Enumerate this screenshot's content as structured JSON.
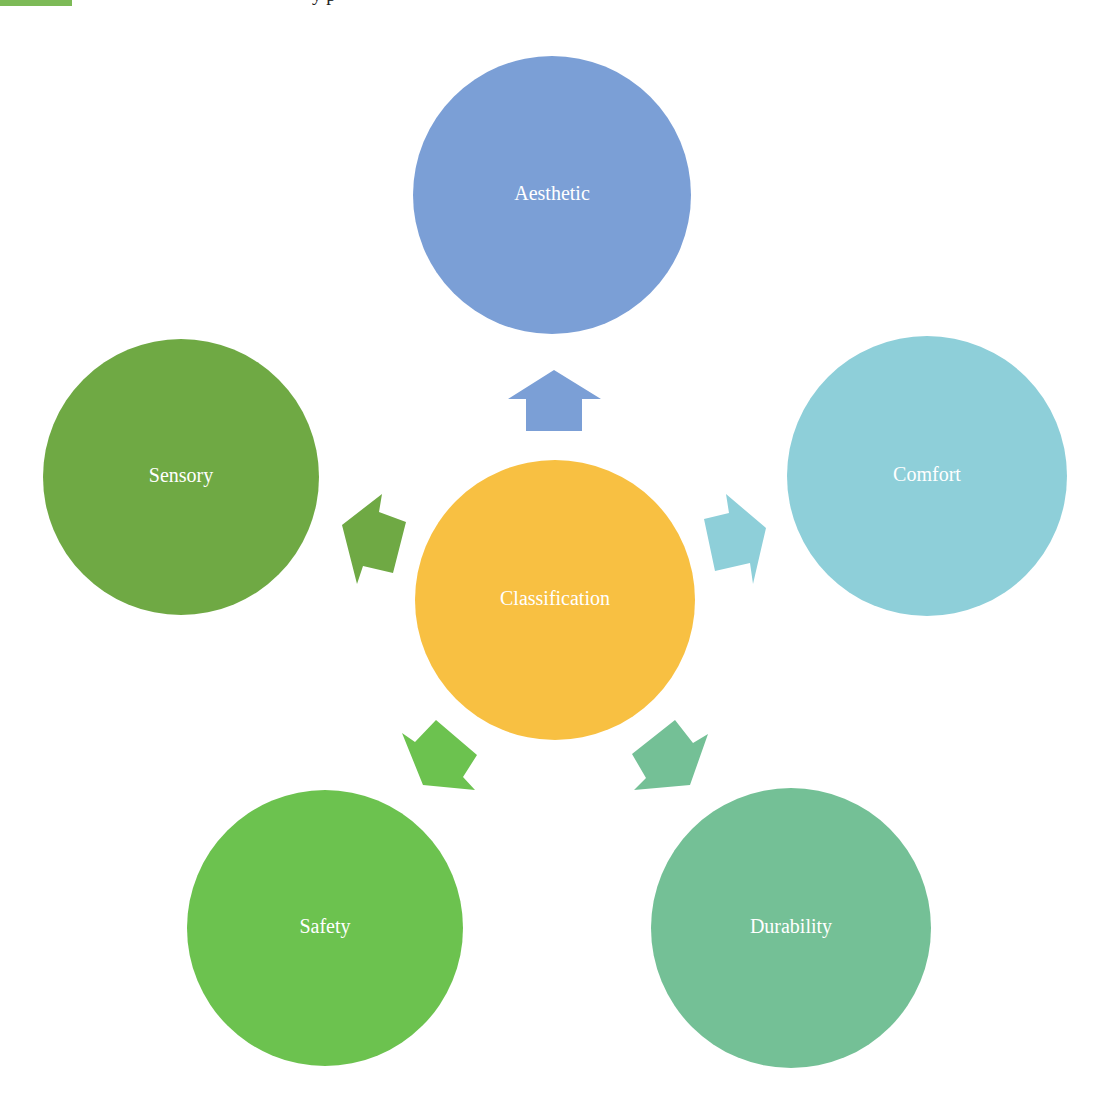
{
  "page": {
    "top_remnant_color": "#7DBA57",
    "clipped_header_text": "y p"
  },
  "diagram": {
    "type": "radial-cycle",
    "center": {
      "label": "Classification",
      "color": "#F8C042",
      "cx": 555,
      "cy": 600,
      "r": 140
    },
    "nodes": [
      {
        "id": "aesthetic",
        "label": "Aesthetic",
        "color": "#7B9FD6",
        "cx": 552,
        "cy": 195,
        "r": 139,
        "arrow": {
          "color": "#7B9FD6",
          "points": "554,370 601,399 582,399 582,431 526,431 526,399 508,399"
        }
      },
      {
        "id": "comfort",
        "label": "Comfort",
        "color": "#8ECFD9",
        "cx": 927,
        "cy": 476,
        "r": 140,
        "arrow": {
          "color": "#8ECFD9",
          "points": "726,494 729,513 704,519 715,571 750,563 753,584 766,528"
        }
      },
      {
        "id": "durability",
        "label": "Durability",
        "color": "#74C096",
        "cx": 791,
        "cy": 928,
        "r": 140,
        "arrow": {
          "color": "#74C096",
          "points": "675,720 693,743 708,734 690,785 634,790 646,778 632,754"
        }
      },
      {
        "id": "safety",
        "label": "Safety",
        "color": "#6CC24F",
        "cx": 325,
        "cy": 928,
        "r": 138,
        "arrow": {
          "color": "#6CC24F",
          "points": "402,733 415,742 436,720 477,755 463,777 475,790 423,785"
        }
      },
      {
        "id": "sensory",
        "label": "Sensory",
        "color": "#6FA944",
        "cx": 181,
        "cy": 477,
        "r": 138,
        "arrow": {
          "color": "#6FA944",
          "points": "342,525 382,494 379,512 406,522 393,573 363,566 357,584"
        }
      }
    ]
  }
}
